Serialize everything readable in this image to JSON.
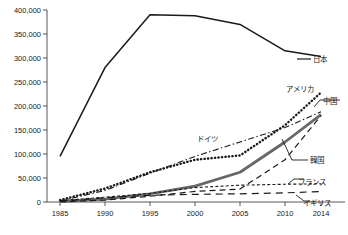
{
  "chart_data": {
    "type": "line",
    "title": "",
    "subtitle": "",
    "xlabel": "",
    "ylabel": "",
    "xlim": [
      1985,
      2014
    ],
    "ylim": [
      0,
      400000
    ],
    "grid": false,
    "legend_position": "inline-right",
    "x": [
      1985,
      1990,
      1995,
      2000,
      2005,
      2010,
      2014
    ],
    "xticklabels": [
      "1985",
      "1990",
      "1995",
      "2000",
      "2005",
      "2010",
      "2014"
    ],
    "yticks": [
      0,
      50000,
      100000,
      150000,
      200000,
      250000,
      300000,
      350000,
      400000
    ],
    "yticklabels": [
      "0",
      "50,000",
      "100,000",
      "150,000",
      "200,000",
      "250,000",
      "300,000",
      "350,000",
      "400,000"
    ],
    "series": [
      {
        "name": "日本",
        "label": "日本",
        "style": "solid",
        "color": "#1a1a1a",
        "width": 1.5,
        "values": [
          95000,
          280000,
          390000,
          388000,
          370000,
          315000,
          303000
        ]
      },
      {
        "name": "アメリカ",
        "label": "アメリカ",
        "style": "dotted",
        "color": "#1a1a1a",
        "width": 2.4,
        "values": [
          4000,
          28000,
          62000,
          88000,
          97000,
          160000,
          228000
        ]
      },
      {
        "name": "中国",
        "label": "中国",
        "style": "solid-thick",
        "color": "#676767",
        "width": 2.8,
        "values": [
          1000,
          6000,
          17000,
          33000,
          62000,
          125000,
          182000
        ]
      },
      {
        "name": "ドイツ",
        "label": "ドイツ",
        "style": "dashdot",
        "color": "#1a1a1a",
        "width": 1.1,
        "values": [
          2000,
          24000,
          60000,
          95000,
          125000,
          155000,
          188000
        ]
      },
      {
        "name": "韓国",
        "label": "韓国",
        "style": "dashed",
        "color": "#1a1a1a",
        "width": 1.2,
        "values": [
          500,
          4000,
          12000,
          22000,
          27000,
          88000,
          180000
        ]
      },
      {
        "name": "フランス",
        "label": "フランス",
        "style": "finedash",
        "color": "#1a1a1a",
        "width": 1.1,
        "values": [
          3000,
          10000,
          18000,
          30000,
          35000,
          37000,
          38000
        ]
      },
      {
        "name": "イギリス",
        "label": "イギリス",
        "style": "longdash",
        "color": "#1a1a1a",
        "width": 1.2,
        "values": [
          1500,
          9000,
          14000,
          16000,
          17000,
          19000,
          22000
        ]
      }
    ],
    "annotations": [
      {
        "label": "日本",
        "series": "日本",
        "x": 2014,
        "y": 303000,
        "leader": true
      },
      {
        "label": "アメリカ",
        "series": "アメリカ",
        "x": 2014,
        "y": 228000,
        "leader": false
      },
      {
        "label": "中国",
        "series": "中国",
        "x": 2014,
        "y": 182000,
        "leader": true
      },
      {
        "label": "ドイツ",
        "series": "ドイツ",
        "x": 2003,
        "y": 128000,
        "leader": false
      },
      {
        "label": "韓国",
        "series": "韓国",
        "x": 2014,
        "y": 180000,
        "leader": true
      },
      {
        "label": "フランス",
        "series": "フランス",
        "x": 2014,
        "y": 38000,
        "leader": true
      },
      {
        "label": "イギリス",
        "series": "イギリス",
        "x": 2014,
        "y": 22000,
        "leader": true
      }
    ]
  },
  "axes": {
    "y_tick_labels": [
      "400,000",
      "350,000",
      "300,000",
      "250,000",
      "200,000",
      "150,000",
      "100,000",
      "50,000",
      "0"
    ],
    "x_tick_labels": [
      "1985",
      "1990",
      "1995",
      "2000",
      "2005",
      "2010",
      "2014"
    ]
  },
  "labels": {
    "japan": "日本",
    "america": "アメリカ",
    "china": "中国",
    "germany": "ドイツ",
    "korea": "韓国",
    "france": "フランス",
    "uk": "イギリス"
  },
  "colors": {
    "axis": "#444444",
    "line_dark": "#1a1a1a",
    "line_gray": "#676767",
    "background": "#ffffff"
  }
}
